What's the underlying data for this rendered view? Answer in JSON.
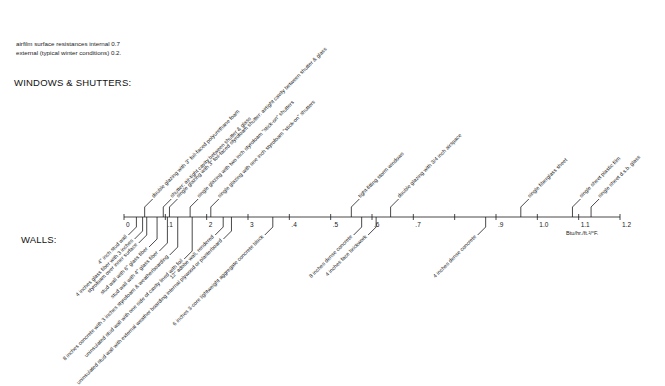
{
  "notes": {
    "line1": "airfilm surface resistances internal 0.7",
    "line2": "external (typical winter conditions) 0.2."
  },
  "headings": {
    "windows": "WINDOWS & SHUTTERS:",
    "walls": "WALLS:"
  },
  "axis": {
    "unit_label": "Btu/hr./ft.²/°F.",
    "min": 0,
    "max": 1.2,
    "ticks": [
      {
        "value": 0,
        "label": "0"
      },
      {
        "value": 0.1,
        "label": ".1"
      },
      {
        "value": 0.2,
        "label": "2"
      },
      {
        "value": 0.3,
        "label": "3"
      },
      {
        "value": 0.4,
        "label": ".4"
      },
      {
        "value": 0.5,
        "label": ".5"
      },
      {
        "value": 0.6,
        "label": ".6"
      },
      {
        "value": 0.7,
        "label": ".7"
      },
      {
        "value": 0.8,
        "label": ""
      },
      {
        "value": 0.9,
        "label": ".9"
      },
      {
        "value": 1.0,
        "label": "1.0"
      },
      {
        "value": 1.1,
        "label": "1.1"
      },
      {
        "value": 1.2,
        "label": "1.2"
      }
    ]
  },
  "windows_shutters": [
    {
      "label": "double glazing with 3\" foil-faced polyurethane foam",
      "u": 0.05
    },
    {
      "label": "shutter: air-tight cavity between shutter & glass",
      "u": 0.095
    },
    {
      "label": "single glazing with 3\" foil-faced styrofoam shutter: airtight cavity between shutter & glass",
      "u": 0.11
    },
    {
      "label": "single glazing with two inch styrofoam \"stick-on\" shutters",
      "u": 0.16
    },
    {
      "label": "single glazing with one inch styrofoam \"stick-on\" shutters",
      "u": 0.21
    },
    {
      "label": "tight-fitting storm windows",
      "u": 0.55
    },
    {
      "label": "double glazing with 3/4 inch airspace",
      "u": 0.645
    },
    {
      "label": "single fiberglass sheet",
      "u": 0.96
    },
    {
      "label": "single sheet plastic film",
      "u": 1.085
    },
    {
      "label": "single sheet d.s.b. glass",
      "u": 1.13
    }
  ],
  "walls": [
    {
      "label": "4\" inch stud wall",
      "u": 0.03
    },
    {
      "label": "4 inches glass fiber with 3 inches",
      "u": 0.045
    },
    {
      "label": "styrofoam over inner surface",
      "u": 0.055
    },
    {
      "label": "stud wall with 6\" glass fiber",
      "u": 0.08
    },
    {
      "label": "stud wall with 4\" glass fiber",
      "u": 0.105
    },
    {
      "label": "8 inches concrete with 3 inches styrofoam & weatherboarding",
      "u": 0.13
    },
    {
      "label": "uninsulated stud wall with one side of cavity lined with foil",
      "u": 0.165
    },
    {
      "label": "12\" adobe wall, rendered",
      "u": 0.24
    },
    {
      "label": "uninsulated stud wall with external weather boarding internal plywood or plasterboard",
      "u": 0.26
    },
    {
      "label": "6 inches 3-core lightweight aggregate concrete block",
      "u": 0.36
    },
    {
      "label": "8 inches dense concrete",
      "u": 0.575
    },
    {
      "label": "4 inches face brickwork",
      "u": 0.61
    },
    {
      "label": "4 inches dense concrete",
      "u": 0.875
    }
  ]
}
